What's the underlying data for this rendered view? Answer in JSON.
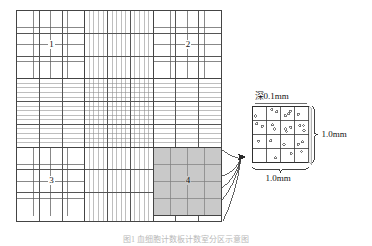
{
  "figure": {
    "caption": "图1  血细胞计数板计数室分区示意图"
  },
  "chamber": {
    "name": "main-counting-chamber",
    "quadrant_labels": [
      "1",
      "2",
      "3",
      "4"
    ],
    "major_divisions": 9,
    "corner_subdivisions": 4,
    "shaded_quadrant": "4",
    "shaded_color": "#c9c9c9",
    "line_color": "#555555",
    "border_color": "#444444",
    "fine_line_color": "#888888"
  },
  "detail": {
    "name": "enlarged-corner-square",
    "rows": 4,
    "cols": 4,
    "depth_label": "深0.1mm",
    "height_label": "1.0mm",
    "width_label": "1.0mm",
    "dot_color": "#6b6b6b",
    "cell_dots": [
      [
        1,
        2,
        3,
        1
      ],
      [
        2,
        2,
        3,
        3
      ],
      [
        1,
        1,
        1,
        2
      ],
      [
        0,
        1,
        1,
        1
      ]
    ]
  },
  "leader": {
    "name": "magnify-leader-lines",
    "count": 5
  }
}
